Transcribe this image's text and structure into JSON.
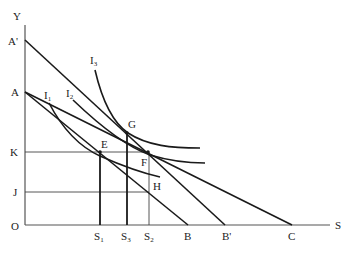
{
  "diagram": {
    "axes": {
      "y_label": "Y",
      "x_label": "S",
      "origin_label": "O"
    },
    "y_points": [
      {
        "id": "A_prime",
        "label": "A'"
      },
      {
        "id": "A",
        "label": "A"
      },
      {
        "id": "K",
        "label": "K"
      },
      {
        "id": "J",
        "label": "J"
      }
    ],
    "x_points": [
      {
        "id": "S1",
        "label": "S",
        "sub": "1"
      },
      {
        "id": "S3",
        "label": "S",
        "sub": "3"
      },
      {
        "id": "S2",
        "label": "S",
        "sub": "2"
      },
      {
        "id": "B",
        "label": "B"
      },
      {
        "id": "B_prime",
        "label": "B'"
      },
      {
        "id": "C",
        "label": "C"
      }
    ],
    "budget_lines": [
      {
        "name": "A'B'",
        "from": "A'",
        "to": "B'"
      },
      {
        "name": "AB",
        "from": "A",
        "to": "B"
      },
      {
        "name": "AC",
        "from": "A",
        "to": "C"
      }
    ],
    "indifference_curves": [
      {
        "label": "I",
        "sub": "1"
      },
      {
        "label": "I",
        "sub": "2"
      },
      {
        "label": "I",
        "sub": "3"
      }
    ],
    "points": [
      {
        "id": "E",
        "label": "E"
      },
      {
        "id": "G",
        "label": "G"
      },
      {
        "id": "F",
        "label": "F"
      },
      {
        "id": "H",
        "label": "H"
      }
    ]
  }
}
